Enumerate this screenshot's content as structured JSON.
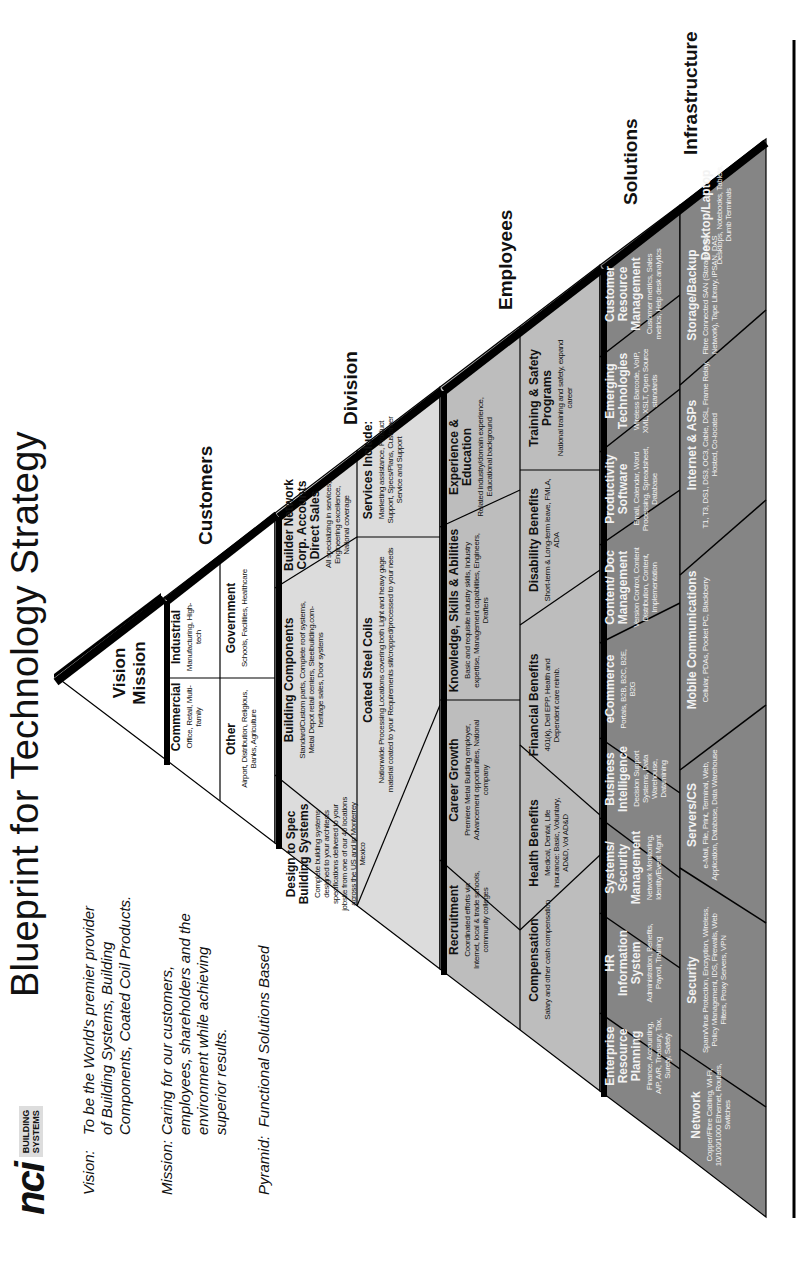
{
  "header": {
    "title": "Blueprint for Technology Strategy",
    "logo": {
      "mark": "nci",
      "sub_line1": "BUILDING",
      "sub_line2": "SYSTEMS"
    }
  },
  "statements": {
    "vision_label": "Vision:",
    "vision_lines": [
      "To be the World's premier provider",
      "of Building Systems, Building",
      "Components, Coated Coil Products."
    ],
    "mission_label": "Mission:",
    "mission_lines": [
      "Caring for our customers,",
      "employees, shareholders and the",
      "environment while achieving",
      "superior results."
    ],
    "pyramid_label": "Pyramid:",
    "pyramid_text": "Functional Solutions Based"
  },
  "colors": {
    "tier_white": "#ffffff",
    "tier_division": "#dcdcdc",
    "tier_employees": "#bdbdbd",
    "tier_solutions": "#858585",
    "tier_infrastructure": "#858585",
    "border": "#000000"
  },
  "pyramid": {
    "apex": {
      "line1": "Vision",
      "line2": "Mission"
    },
    "tier_labels": {
      "customers": "Customers",
      "division": "Division",
      "employees": "Employees",
      "solutions": "Solutions",
      "infrastructure": "Infrastructure"
    },
    "customers": [
      {
        "title": "Commercial",
        "desc": "Office, Retail, Multi-family"
      },
      {
        "title": "Industrial",
        "desc": "Manufacturing, High-tech"
      },
      {
        "title": "Other",
        "desc": "Airport, Distribution, Religious, Banks, Agriculture"
      },
      {
        "title": "Government",
        "desc": "Schools, Facilities, Healthcare"
      }
    ],
    "division": [
      {
        "title": "Design to Spec Building Systems",
        "desc": "Complete building systems designed to your architects specifications delivered to your jobsite from one of our 46 locations across the US and in Monterrey Mexico"
      },
      {
        "title": "Building Components",
        "desc": "Standard/Custom parts, Complete roof systems, Metal Depot retail centers, Steelbuilding.com-heritage sales, Door systems"
      },
      {
        "title": "Builder Network Corp. Accounts Direct Sales",
        "desc": "All specializing in services, Engineering excellence, National coverage"
      },
      {
        "title": "Coated Steel Coils",
        "desc": "Nationwide Processing Locations covering both Light and heavy gage material coated to your Requirements slit/cropped/processed to your needs"
      },
      {
        "title": "Services Include:",
        "desc": "Marketing assistance, Product Support, Specs/Plans, Customer Service and Support"
      }
    ],
    "employees": [
      {
        "title": "Recruitment",
        "desc": "Coordinated efforts via Internet, local & trade schools, community colleges"
      },
      {
        "title": "Career Growth",
        "desc": "Premiere Metal Building employer, Advancement opportunities, National company"
      },
      {
        "title": "Knowledge, Skills & Abilities",
        "desc": "Basic and requisite industry skills, Industry expertise, Management capabilities, Engineers, Drafters"
      },
      {
        "title": "Experience & Education",
        "desc": "Related industry/domain experience, Educational background"
      },
      {
        "title": "Compensation",
        "desc": "Salary and other cash compensation"
      },
      {
        "title": "Health Benefits",
        "desc": "Medical, Dental, Life Insurance: Basic, Voluntary, AD&D, Vol AD&D"
      },
      {
        "title": "Financial Benefits",
        "desc": "401(k), Dell EPP, Health and Dependent care reimb."
      },
      {
        "title": "Disability Benefits",
        "desc": "Short-term & Long-term leave, FMLA, ADA"
      },
      {
        "title": "Training & Safety Programs",
        "desc": "National training and safety, expand career"
      }
    ],
    "solutions": [
      {
        "title": "Enterprise Resource Planning",
        "desc": "Finance, Accounting, A/P, A/R, Treasury, Tax, Surety, Safety"
      },
      {
        "title": "HR Information System",
        "desc": "Administration, Benefits, Payroll, Training"
      },
      {
        "title": "Systems/ Security Management",
        "desc": "Network Monitoring, Identity/Event Mgmt"
      },
      {
        "title": "Business Intelligence",
        "desc": "Decision Support Systems, Data Warehouse, Datamining"
      },
      {
        "title": "eCommerce",
        "desc": "Portals, B2B, B2C, B2E, B2G"
      },
      {
        "title": "Content/ Doc Management",
        "desc": "Version Control, Content Distribution, Content, Implementation"
      },
      {
        "title": "Productivity Software",
        "desc": "Email, Calendar, Word Processing, Spreadsheet, Database"
      },
      {
        "title": "Emerging Technologies",
        "desc": "Wireless Barcode, VoIP, XML, XSLT, Open Source standards"
      },
      {
        "title": "Customer Resource Management",
        "desc": "Customer metrics, Sales metrics, Help desk analytics"
      }
    ],
    "infrastructure": [
      {
        "title": "Network",
        "desc": "Copper/Fibre Cabling, Wi-Fi, 10/100/1000 Ethernet, Routers, Switches"
      },
      {
        "title": "Security",
        "desc": "Spam/Virus Protection, Encryption, Wireless, Policy Management, IDS, Firewalls, Web Filters, Proxy Servers, VPN"
      },
      {
        "title": "Servers/CS",
        "desc": "e-Mail, File, Print, Terminal, Web, Application, Database, Data Warehouse"
      },
      {
        "title": "Mobile Communications",
        "desc": "Cellular, PDAs, Pocket PC, Blackberry"
      },
      {
        "title": "Internet & ASPs",
        "desc": "T1, T3, DS1, DS3, OC3, Cable, DSL, Frame Relay, Hosted, Co-located"
      },
      {
        "title": "Storage/Backup",
        "desc": "Fibre Connected SAN (Storage Area Network), Tape Library, iPSAN, DAS"
      },
      {
        "title": "Desktop/Laptop",
        "desc": "Desktops, Notebooks, Tablets, Dumb Terminals"
      }
    ]
  }
}
